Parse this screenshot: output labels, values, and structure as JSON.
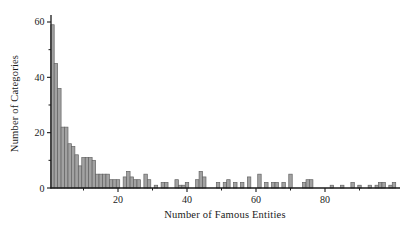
{
  "figure": {
    "background": "#ffffff"
  },
  "chart_data": {
    "type": "histogram",
    "title": "",
    "xlabel": "Number of Famous Entities",
    "ylabel": "Number of Categories",
    "bin_start": 1,
    "bin_width": 1,
    "values": [
      59,
      45,
      36,
      22,
      22,
      16,
      15,
      12,
      8,
      11,
      11,
      11,
      10,
      5,
      5,
      5,
      5,
      3,
      3,
      3,
      0,
      4,
      6,
      4,
      3,
      3,
      0,
      5,
      3,
      0,
      1,
      0,
      2,
      2,
      0,
      0,
      3,
      1,
      1,
      2,
      0,
      0,
      3,
      6,
      4,
      0,
      0,
      0,
      2,
      0,
      2,
      3,
      0,
      2,
      0,
      2,
      0,
      4,
      0,
      0,
      5,
      0,
      2,
      0,
      2,
      2,
      0,
      2,
      0,
      5,
      0,
      0,
      0,
      2,
      3,
      3,
      0,
      0,
      0,
      0,
      0,
      1,
      0,
      0,
      1,
      0,
      0,
      2,
      0,
      1,
      0,
      0,
      1,
      0,
      1,
      2,
      2,
      0,
      1,
      2,
      0
    ],
    "x_ticks_major": [
      20,
      40,
      60,
      80
    ],
    "x_ticks_minor": [
      10,
      30,
      50,
      70,
      90
    ],
    "y_ticks_major": [
      0,
      20,
      40,
      60
    ],
    "y_ticks_minor": [
      10,
      30,
      50
    ],
    "xlim": [
      0,
      102
    ],
    "ylim": [
      0,
      62
    ],
    "legend": null,
    "grid": false,
    "colors": {
      "bar_fill": "#a2a2a2",
      "bar_edge": "#636363",
      "axis": "#1a1a1a",
      "text": "#1a1a1a"
    }
  }
}
